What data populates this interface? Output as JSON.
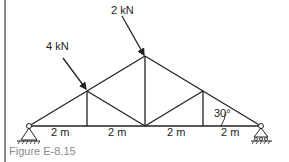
{
  "figure": {
    "caption": "Figure E-8.15",
    "loads": [
      {
        "label": "4 kN",
        "node": "top-left"
      },
      {
        "label": "2 kN",
        "node": "apex"
      }
    ],
    "spans": [
      "2 m",
      "2 m",
      "2 m",
      "2 m"
    ],
    "angle": "30°",
    "supports": [
      "pin",
      "roller"
    ],
    "colors": {
      "members": "#222222",
      "border": "#8a8a8a",
      "caption": "#8a8a8a"
    }
  }
}
